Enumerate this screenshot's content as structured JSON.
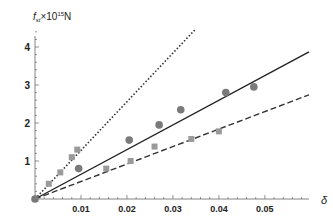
{
  "chart_data": {
    "type": "scatter",
    "title": "",
    "ylabel": "f_st×10^15 N",
    "ylabel_main": "f",
    "ylabel_sub": "st",
    "ylabel_rest": "×10",
    "ylabel_exp": "15",
    "ylabel_unit": "N",
    "xlabel": "δ",
    "xlim": [
      0,
      0.0596
    ],
    "ylim": [
      0,
      4.5
    ],
    "x_ticks": [
      0.01,
      0.02,
      0.03,
      0.04,
      0.05
    ],
    "x_tick_labels": [
      "0.01",
      "0.02",
      "0.03",
      "0.04",
      "0.05"
    ],
    "y_ticks": [
      1,
      2,
      3,
      4
    ],
    "y_tick_labels": [
      "1",
      "2",
      "3",
      "4"
    ],
    "grid": false,
    "legend": null,
    "series": [
      {
        "name": "squares",
        "marker": "square",
        "color": "#9a9a9a",
        "x": [
          0.0,
          0.003,
          0.0055,
          0.008,
          0.0092,
          0.0155,
          0.0208,
          0.026,
          0.034,
          0.04
        ],
        "y": [
          0.0,
          0.4,
          0.7,
          1.1,
          1.3,
          0.8,
          1.0,
          1.38,
          1.58,
          1.78
        ]
      },
      {
        "name": "circles",
        "marker": "circle",
        "color": "#7a7a7a",
        "x": [
          0.0,
          0.0095,
          0.0205,
          0.027,
          0.0317,
          0.0415,
          0.0476
        ],
        "y": [
          0.0,
          0.8,
          1.55,
          1.95,
          2.35,
          2.8,
          2.95
        ]
      }
    ],
    "lines": [
      {
        "name": "dotted-fit",
        "style": "dotted",
        "slope": 128,
        "x_end": 0.035,
        "color": "#333333"
      },
      {
        "name": "solid-fit",
        "style": "solid",
        "slope": 65,
        "x_end": 0.0596,
        "color": "#222222"
      },
      {
        "name": "dashed-fit",
        "style": "dashed",
        "slope": 46,
        "x_end": 0.0596,
        "color": "#333333"
      }
    ]
  }
}
